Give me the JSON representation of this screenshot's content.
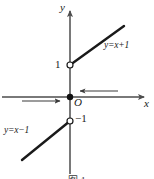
{
  "figure": {
    "kind": "coordinate-plane-graph",
    "background_color": "#ffffff",
    "ink_color": "#1a1a1a",
    "axis_color": "#4d4d4d",
    "width": 154,
    "height": 179,
    "axes": {
      "x_axis_label": "x",
      "y_axis_label": "y",
      "origin_label": "O",
      "x_axis": {
        "x1": 2,
        "y1": 97,
        "x2": 150,
        "y2": 97,
        "arrow": "right"
      },
      "y_axis": {
        "x1": 70,
        "y1": 174,
        "x2": 70,
        "y2": 5,
        "arrow": "up"
      }
    },
    "origin_point": {
      "x": 70,
      "y": 97,
      "filled": true,
      "label": "O"
    },
    "tick_labels": [
      {
        "text": "1",
        "x": 56,
        "y": 60,
        "anchor": "y-axis-positive"
      },
      {
        "text": "−1",
        "x": 76,
        "y": 114,
        "anchor": "y-axis-negative"
      }
    ],
    "open_points": [
      {
        "cx": 70,
        "cy": 65,
        "r": 3,
        "meaning": "hole at (0,1)"
      },
      {
        "cx": 70,
        "cy": 121,
        "r": 3,
        "meaning": "hole at (0,-1)"
      }
    ],
    "segments": [
      {
        "name": "upper-ray",
        "equation_label": "y=x+1",
        "x1": 70,
        "y1": 65,
        "x2": 124,
        "y2": 26,
        "stroke_width": 2.4
      },
      {
        "name": "lower-ray",
        "equation_label": "y=x−1",
        "x1": 22,
        "y1": 160,
        "x2": 70,
        "y2": 121,
        "stroke_width": 2.4
      }
    ],
    "equation_labels": [
      {
        "text": "y=x+1",
        "x": 104,
        "y": 41
      },
      {
        "text": "y=x−1",
        "x": 4,
        "y": 126
      }
    ],
    "direction_arrows": [
      {
        "name": "left-pointing-arrow-right-of-origin",
        "x1": 118,
        "y1": 91,
        "x2": 76,
        "y2": 91,
        "direction": "left"
      },
      {
        "name": "right-pointing-arrow-left-of-origin",
        "x1": 22,
        "y1": 101,
        "x2": 64,
        "y2": 101,
        "direction": "right"
      }
    ]
  },
  "caption": {
    "text": "图 1",
    "visible": "partially-cropped"
  }
}
